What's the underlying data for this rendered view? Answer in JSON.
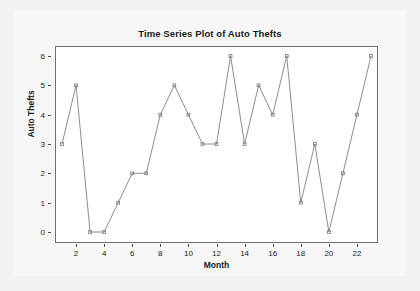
{
  "chart_data": {
    "type": "line",
    "title": "Time Series Plot of Auto Thefts",
    "xlabel": "Month",
    "ylabel": "Auto Thefts",
    "x": [
      1,
      2,
      3,
      4,
      5,
      6,
      7,
      8,
      9,
      10,
      11,
      12,
      13,
      14,
      15,
      16,
      17,
      18,
      19,
      20,
      21,
      22,
      23
    ],
    "values": [
      3,
      5,
      0,
      0,
      1,
      2,
      2,
      4,
      5,
      4,
      3,
      3,
      6,
      3,
      5,
      4,
      6,
      1,
      3,
      0,
      2,
      4,
      6
    ],
    "xlim": [
      1,
      23
    ],
    "ylim": [
      0,
      6
    ],
    "xticks": [
      2,
      4,
      6,
      8,
      10,
      12,
      14,
      16,
      18,
      20,
      22
    ],
    "yticks": [
      0,
      1,
      2,
      3,
      4,
      5,
      6
    ],
    "xtick_labels": [
      "2",
      "4",
      "6",
      "8",
      "10",
      "12",
      "14",
      "16",
      "18",
      "20",
      "22"
    ],
    "ytick_labels": [
      "0",
      "1",
      "2",
      "3",
      "4",
      "5",
      "6"
    ],
    "grid": false,
    "legend": null,
    "series_color": "#808080",
    "marker": "square",
    "marker_color": "#808080",
    "frame_color": "#6e6e6e",
    "plot_background": "#ffffff",
    "figure_background": "#f7f7f7"
  }
}
